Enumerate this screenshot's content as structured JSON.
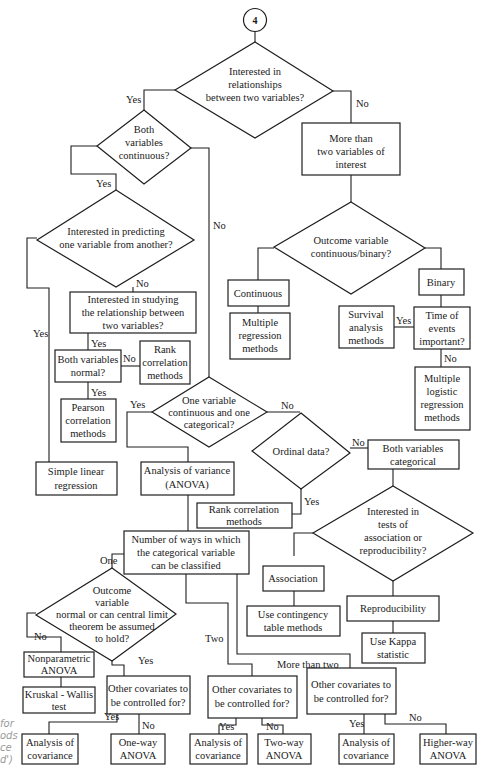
{
  "connector": {
    "label": "4"
  },
  "nodes": {
    "q_relationships": [
      "Interested in",
      "relationships",
      "between two variables?"
    ],
    "q_both_continuous": [
      "Both",
      "variables",
      "continuous?"
    ],
    "more_than_two": [
      "More than",
      "two variables of",
      "interest"
    ],
    "q_predicting": [
      "Interested in predicting",
      "one variable from another?"
    ],
    "q_outcome": [
      "Outcome variable",
      "continuous/binary?"
    ],
    "continuous": [
      "Continuous"
    ],
    "binary": [
      "Binary"
    ],
    "multiple_regression": [
      "Multiple",
      "regression",
      "methods"
    ],
    "survival": [
      "Survival",
      "analysis",
      "methods"
    ],
    "q_time_events": [
      "Time of",
      "events",
      "important?"
    ],
    "multiple_logistic": [
      "Multiple",
      "logistic",
      "regression",
      "methods"
    ],
    "q_studying": [
      "Interested in studying",
      "the relationship between",
      "two variables?"
    ],
    "q_both_normal": [
      "Both variables",
      "normal?"
    ],
    "rank_corr_1": [
      "Rank",
      "correlation",
      "methods"
    ],
    "pearson": [
      "Pearson",
      "correlation",
      "methods"
    ],
    "q_one_cont_one_cat": [
      "One variable",
      "continuous and one",
      "categorical?"
    ],
    "simple_linear": [
      "Simple linear",
      "regression"
    ],
    "anova": [
      "Analysis of variance",
      "(ANOVA)"
    ],
    "q_ordinal": [
      "Ordinal data?"
    ],
    "both_categorical": [
      "Both variables",
      "categorical"
    ],
    "rank_corr_2": [
      "Rank correlation",
      "methods"
    ],
    "q_assoc_repro": [
      "Interested in",
      "tests of",
      "association or",
      "reproducibility?"
    ],
    "num_ways": [
      "Number of ways in which",
      "the categorical variable",
      "can be classified"
    ],
    "association": [
      "Association"
    ],
    "contingency": [
      "Use contingency",
      "table methods"
    ],
    "reproducibility": [
      "Reproducibility"
    ],
    "kappa": [
      "Use Kappa",
      "statistic"
    ],
    "q_outcome_normal": [
      "Outcome",
      "variable",
      "normal or can central limit",
      "theorem be assumed",
      "to hold?"
    ],
    "nonparametric": [
      "Nonparametric",
      "ANOVA"
    ],
    "kruskal": [
      "Kruskal - Wallis",
      "test"
    ],
    "q_covariates_1": [
      "Other covariates to",
      "be controlled for?"
    ],
    "q_covariates_2": [
      "Other covariates to",
      "be controlled for?"
    ],
    "q_covariates_3": [
      "Other covariates to",
      "be controlled for?"
    ],
    "ancova_1": [
      "Analysis of",
      "covariance"
    ],
    "oneway": [
      "One-way",
      "ANOVA"
    ],
    "ancova_2": [
      "Analysis of",
      "covariance"
    ],
    "twoway": [
      "Two-way",
      "ANOVA"
    ],
    "ancova_3": [
      "Analysis of",
      "covariance"
    ],
    "higherway": [
      "Higher-way",
      "ANOVA"
    ]
  },
  "edge_labels": {
    "yes_1": "Yes",
    "no_1": "No",
    "yes_2": "Yes",
    "no_2": "No",
    "no_3": "No",
    "yes_3": "Yes",
    "yes_4": "Yes",
    "no_4": "No",
    "yes_5": "Yes",
    "yes_6": "Yes",
    "no_6": "No",
    "no_7": "No",
    "no_8": "No",
    "yes_8": "Yes",
    "one": "One",
    "two": "Two",
    "more_than_two": "More than  two",
    "no_9": "No",
    "yes_9": "Yes",
    "yes_10": "Yes",
    "no_10": "No",
    "yes_11": "Yes",
    "no_11": "No",
    "yes_12": "Yes",
    "no_12": "No"
  },
  "caption_fragment": [
    "for",
    "ods",
    "ce",
    "d')"
  ]
}
